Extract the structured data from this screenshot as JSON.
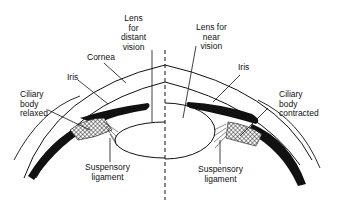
{
  "diagram": {
    "colors": {
      "ink": "#111111",
      "background": "#ffffff"
    },
    "left_half": {
      "state": "distant vision",
      "labels": {
        "lens": [
          "Lens",
          "for",
          "distant",
          "vision"
        ],
        "cornea": "Cornea",
        "iris": "Iris",
        "ciliary": [
          "Ciliary",
          "body",
          "relaxed"
        ],
        "suspensory": [
          "Suspensory",
          "ligament"
        ]
      }
    },
    "right_half": {
      "state": "near vision",
      "labels": {
        "lens": [
          "Lens for",
          "near",
          "vision"
        ],
        "iris": "Iris",
        "ciliary": [
          "Ciliary",
          "body",
          "contracted"
        ],
        "suspensory": [
          "Suspensory",
          "ligament"
        ]
      }
    },
    "divider": "dashed vertical midline"
  }
}
